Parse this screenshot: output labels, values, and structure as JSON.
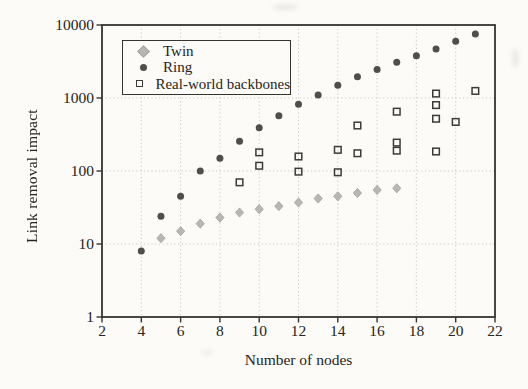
{
  "chart_data": {
    "type": "scatter",
    "title": "",
    "xlabel": "Number of nodes",
    "ylabel": "Link removal impact",
    "x_scale": "linear",
    "y_scale": "log",
    "xlim": [
      2,
      22
    ],
    "ylim": [
      1,
      10000
    ],
    "x_ticks": [
      2,
      4,
      6,
      8,
      10,
      12,
      14,
      16,
      18,
      20,
      22
    ],
    "y_ticks": [
      1,
      10,
      100,
      1000,
      10000
    ],
    "grid": {
      "style": "dotted",
      "x_at": [
        4,
        6,
        8,
        10,
        12,
        14,
        16,
        18,
        20
      ],
      "y_at": [
        10,
        100,
        1000
      ]
    },
    "legend": {
      "position": "top-left",
      "entries": [
        "Twin",
        "Ring",
        "Real-world backbones"
      ]
    },
    "series": [
      {
        "name": "Twin",
        "marker": "diamond",
        "color": "#b7b7b4",
        "edge_color": "#9f9f9c",
        "points": [
          [
            5,
            12
          ],
          [
            6,
            15
          ],
          [
            7,
            19
          ],
          [
            8,
            23
          ],
          [
            9,
            27
          ],
          [
            10,
            30
          ],
          [
            11,
            33
          ],
          [
            12,
            37
          ],
          [
            13,
            42
          ],
          [
            14,
            45
          ],
          [
            15,
            50
          ],
          [
            16,
            55
          ],
          [
            17,
            58
          ]
        ]
      },
      {
        "name": "Ring",
        "marker": "circle",
        "color": "#4e4e4a",
        "points": [
          [
            4,
            8
          ],
          [
            5,
            24
          ],
          [
            6,
            45
          ],
          [
            7,
            100
          ],
          [
            8,
            150
          ],
          [
            9,
            255
          ],
          [
            10,
            390
          ],
          [
            11,
            570
          ],
          [
            12,
            820
          ],
          [
            13,
            1100
          ],
          [
            14,
            1500
          ],
          [
            15,
            1950
          ],
          [
            16,
            2450
          ],
          [
            17,
            3100
          ],
          [
            18,
            3800
          ],
          [
            19,
            4700
          ],
          [
            20,
            6000
          ],
          [
            21,
            7500
          ]
        ]
      },
      {
        "name": "Real-world backbones",
        "marker": "open-square",
        "color": "#3c3b37",
        "points": [
          [
            9,
            70
          ],
          [
            10,
            180
          ],
          [
            10,
            118
          ],
          [
            12,
            158
          ],
          [
            12,
            98
          ],
          [
            14,
            195
          ],
          [
            14,
            96
          ],
          [
            15,
            420
          ],
          [
            15,
            175
          ],
          [
            17,
            650
          ],
          [
            17,
            245
          ],
          [
            17,
            190
          ],
          [
            19,
            1150
          ],
          [
            19,
            800
          ],
          [
            19,
            520
          ],
          [
            19,
            185
          ],
          [
            20,
            470
          ],
          [
            21,
            1250
          ]
        ]
      }
    ],
    "colors": {
      "axis": "#35342f",
      "grid": "#c9c9c4",
      "paper": "#fcfbf8",
      "text": "#262521"
    }
  }
}
